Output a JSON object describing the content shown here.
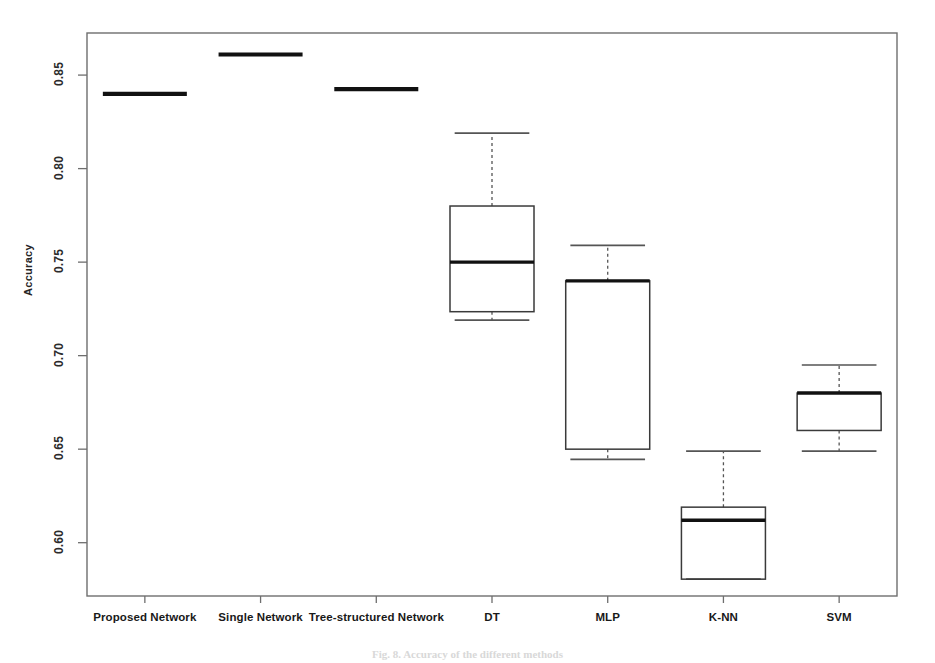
{
  "chart_data": {
    "type": "box",
    "title": "",
    "xlabel": "",
    "ylabel": "Accuracy",
    "grid": false,
    "legend": null,
    "ylim": [
      0.5715,
      0.8725
    ],
    "ytick_labels": [
      "0.60",
      "0.65",
      "0.70",
      "0.75",
      "0.80",
      "0.85"
    ],
    "ytick_values": [
      0.6,
      0.65,
      0.7,
      0.75,
      0.8,
      0.85
    ],
    "categories": [
      "Proposed Network",
      "Single Network",
      "Tree-structured Network",
      "DT",
      "MLP",
      "K-NN",
      "SVM"
    ],
    "boxes": [
      {
        "category": "Proposed Network",
        "whisker_low": 0.84,
        "q1": 0.84,
        "median": 0.84,
        "q3": 0.84,
        "whisker_high": 0.84,
        "degenerate": true
      },
      {
        "category": "Single Network",
        "whisker_low": 0.861,
        "q1": 0.861,
        "median": 0.861,
        "q3": 0.861,
        "whisker_high": 0.861,
        "degenerate": true
      },
      {
        "category": "Tree-structured Network",
        "whisker_low": 0.8425,
        "q1": 0.8425,
        "median": 0.8425,
        "q3": 0.8425,
        "whisker_high": 0.8425,
        "degenerate": true
      },
      {
        "category": "DT",
        "whisker_low": 0.719,
        "q1": 0.7235,
        "median": 0.75,
        "q3": 0.78,
        "whisker_high": 0.819,
        "degenerate": false
      },
      {
        "category": "MLP",
        "whisker_low": 0.6445,
        "q1": 0.65,
        "median": 0.74,
        "q3": 0.74,
        "whisker_high": 0.759,
        "degenerate": false
      },
      {
        "category": "K-NN",
        "whisker_low": 0.5805,
        "q1": 0.5805,
        "median": 0.612,
        "q3": 0.619,
        "whisker_high": 0.649,
        "degenerate": false
      },
      {
        "category": "SVM",
        "whisker_low": 0.649,
        "q1": 0.66,
        "median": 0.68,
        "q3": 0.68,
        "whisker_high": 0.695,
        "degenerate": false
      }
    ],
    "colors": {
      "box_line": "#3a3a3a",
      "median_line": "#111111",
      "whisker_line": "#555555",
      "frame": "#6e6e6e",
      "background": "#ffffff"
    }
  },
  "caption": {
    "text": "Fig. 8.   Accuracy of the different methods"
  }
}
